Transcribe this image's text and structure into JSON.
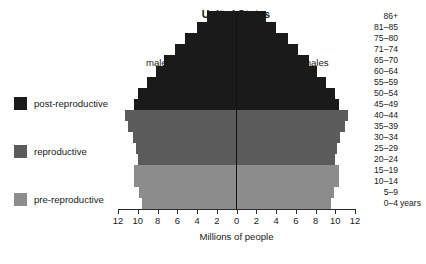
{
  "chart": {
    "title": "United States",
    "xlabel": "Millions of people",
    "males_label": "males",
    "females_label": "females",
    "age_unit_suffix": "years"
  },
  "legend": {
    "items": [
      {
        "label": "post-reproductive",
        "color": "#1a1a1a"
      },
      {
        "label": "reproductive",
        "color": "#5b5b5b"
      },
      {
        "label": "pre-reproductive",
        "color": "#8c8c8c"
      }
    ]
  },
  "axis": {
    "ticks": [
      "12",
      "10",
      "8",
      "6",
      "4",
      "2",
      "0",
      "2",
      "4",
      "6",
      "8",
      "10",
      "12"
    ],
    "tick_values": [
      -12,
      -10,
      -8,
      -6,
      -4,
      -2,
      0,
      2,
      4,
      6,
      8,
      10,
      12
    ],
    "min": -12,
    "max": 12
  },
  "chart_data": {
    "type": "bar",
    "subtype": "population-pyramid",
    "title": "United States",
    "xlabel": "Millions of people",
    "ylabel": "",
    "xlim": [
      -12,
      12
    ],
    "grid": false,
    "legend_position": "left",
    "categories": [
      "86+",
      "81–85",
      "75–80",
      "71–74",
      "65–70",
      "60–64",
      "55–59",
      "50–54",
      "45–49",
      "40–44",
      "35–39",
      "30–34",
      "25–29",
      "20–24",
      "15–19",
      "10–14",
      "5–9",
      "0–4"
    ],
    "series": [
      {
        "name": "males",
        "side": "left",
        "values": [
          3.0,
          4.0,
          5.2,
          6.2,
          7.3,
          8.2,
          9.1,
          10.0,
          10.4,
          11.3,
          11.0,
          10.5,
          10.2,
          10.0,
          10.4,
          10.4,
          9.9,
          9.6
        ]
      },
      {
        "name": "females",
        "side": "right",
        "values": [
          3.0,
          4.0,
          5.2,
          6.2,
          7.3,
          8.2,
          9.1,
          10.0,
          10.4,
          11.3,
          11.0,
          10.5,
          10.2,
          10.0,
          10.4,
          10.4,
          9.9,
          9.6
        ]
      }
    ],
    "group_colors": {
      "post-reproductive": "#1a1a1a",
      "reproductive": "#5b5b5b",
      "pre-reproductive": "#8c8c8c"
    },
    "bar_groups": [
      "post-reproductive",
      "post-reproductive",
      "post-reproductive",
      "post-reproductive",
      "post-reproductive",
      "post-reproductive",
      "post-reproductive",
      "post-reproductive",
      "post-reproductive",
      "reproductive",
      "reproductive",
      "reproductive",
      "reproductive",
      "reproductive",
      "pre-reproductive",
      "pre-reproductive",
      "pre-reproductive",
      "pre-reproductive"
    ],
    "age_labels_with_unit": [
      "86+",
      "81–85",
      "75–80",
      "71–74",
      "65–70",
      "60–64",
      "55–59",
      "50–54",
      "45–49",
      "40–44",
      "35–39",
      "30–34",
      "25–29",
      "20–24",
      "15–19",
      "10–14",
      "5–9",
      "0–4 years"
    ]
  }
}
